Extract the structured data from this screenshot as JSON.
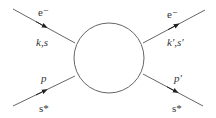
{
  "diagram": {
    "type": "scattering-vertex",
    "colors": {
      "line": "#666666",
      "text": "#333333",
      "background": "#ffffff"
    },
    "blob": {
      "cx": 109,
      "cy": 58,
      "r": 35
    },
    "legs": [
      {
        "id": "incoming-electron",
        "particle": "e⁻",
        "momentum_spin": "k,s",
        "direction": "in"
      },
      {
        "id": "incoming-proton",
        "particle": "p",
        "spin": "s*",
        "direction": "in"
      },
      {
        "id": "outgoing-electron",
        "particle": "e⁻",
        "momentum_spin": "k′,s′",
        "direction": "out"
      },
      {
        "id": "outgoing-proton",
        "particle": "p′",
        "spin": "s*",
        "direction": "out"
      }
    ],
    "labels": {
      "in_electron_particle": "e⁻",
      "in_electron_ks": "k,s",
      "in_proton_particle": "p",
      "in_proton_spin": "s*",
      "out_electron_particle": "e⁻",
      "out_electron_ks": "k′,s′",
      "out_proton_particle": "p′",
      "out_proton_spin": "s*"
    }
  }
}
